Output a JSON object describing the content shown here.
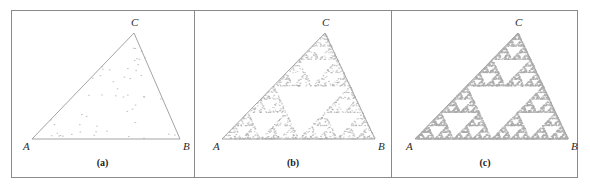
{
  "figure": {
    "type": "sierpinski-chaos-game",
    "panel_count": 3,
    "frame_color": "#8a8a8a",
    "background_color": "#ffffff",
    "outline_color": "#9a9a9a",
    "dot_color": "#a9a9a9"
  },
  "panels": [
    {
      "id": "a",
      "caption": "(a)",
      "vertices": {
        "A": "A",
        "B": "B",
        "C": "C"
      },
      "geometry": {
        "ax": 21,
        "ay": 129,
        "bx": 169,
        "by": 129,
        "cx": 123,
        "cy": 23
      },
      "iterations": 60,
      "depth": 0,
      "description": "Sparse scatter of chaos-game points; no pattern yet visible"
    },
    {
      "id": "b",
      "caption": "(b)",
      "vertices": {
        "A": "A",
        "B": "B",
        "C": "C"
      },
      "geometry": {
        "ax": 27,
        "ay": 129,
        "bx": 180,
        "by": 129,
        "cx": 130,
        "cy": 23
      },
      "iterations": 1500,
      "depth": 4,
      "description": "Sierpinski gasket beginning to emerge from the point cloud"
    },
    {
      "id": "c",
      "caption": "(c)",
      "vertices": {
        "A": "A",
        "B": "B",
        "C": "C"
      },
      "geometry": {
        "ax": 23,
        "ay": 129,
        "bx": 176,
        "by": 129,
        "cx": 126,
        "cy": 23
      },
      "iterations": 6000,
      "depth": 5,
      "description": "Fully resolved Sierpinski triangle fractal"
    }
  ],
  "chart_data": {
    "type": "scatter",
    "title": "",
    "xlabel": "",
    "ylabel": "",
    "series": [
      {
        "name": "(a) early iterations",
        "points": 60
      },
      {
        "name": "(b) intermediate iterations",
        "points": 1500
      },
      {
        "name": "(c) many iterations",
        "points": 6000
      }
    ],
    "annotations": [
      "A",
      "B",
      "C",
      "(a)",
      "(b)",
      "(c)"
    ]
  }
}
